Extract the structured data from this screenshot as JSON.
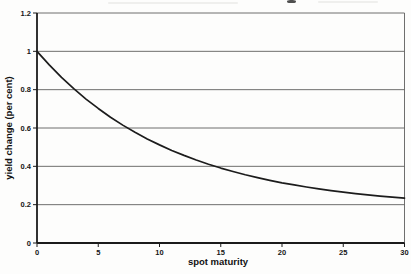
{
  "figure": {
    "background": "#fdfdfc",
    "note": "scanned book figure; chart title cropped off at top edge, only a descender mark remains"
  },
  "colors": {
    "axis": "#1b1b1b",
    "gridline": "#5f5f5d",
    "curve": "#1c1c1c",
    "label_text": "#161616"
  },
  "chart_data": {
    "type": "line",
    "title": "",
    "xlabel": "spot maturity",
    "ylabel": "yield change (per cent)",
    "xlim": [
      0,
      30
    ],
    "ylim": [
      0,
      1.2
    ],
    "xticks": [
      0,
      5,
      10,
      15,
      20,
      25,
      30
    ],
    "xtick_labels": [
      "0",
      "5",
      "10",
      "15",
      "20",
      "25",
      "30"
    ],
    "yticks": [
      0,
      0.2,
      0.4,
      0.6,
      0.8,
      1,
      1.2
    ],
    "ytick_labels": [
      "0",
      "0.2",
      "0.4",
      "0.6",
      "0.8",
      "1",
      "1.2"
    ],
    "grid": "horizontal",
    "plot_border": true,
    "legend": "none",
    "series": [
      {
        "name": "yield change",
        "color": "#1c1c1c",
        "x": [
          0,
          1,
          2,
          3,
          4,
          5,
          6,
          7,
          8,
          9,
          10,
          11,
          12,
          13,
          14,
          15,
          16,
          17,
          18,
          19,
          20,
          21,
          22,
          23,
          24,
          25,
          26,
          27,
          28,
          29,
          30
        ],
        "y": [
          1.0,
          0.929,
          0.864,
          0.805,
          0.751,
          0.702,
          0.656,
          0.615,
          0.578,
          0.543,
          0.512,
          0.483,
          0.457,
          0.433,
          0.411,
          0.391,
          0.373,
          0.356,
          0.341,
          0.327,
          0.314,
          0.303,
          0.292,
          0.282,
          0.273,
          0.265,
          0.258,
          0.251,
          0.245,
          0.239,
          0.234
        ]
      }
    ]
  }
}
